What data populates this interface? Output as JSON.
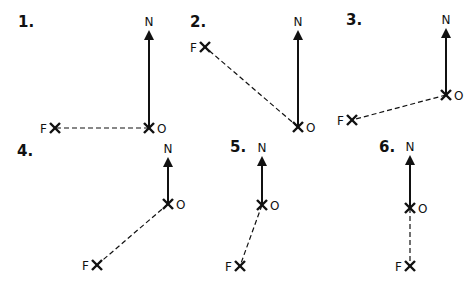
{
  "diagrams": [
    {
      "number": "1.",
      "north_label": "N",
      "origin_label": "O",
      "far_label": "F",
      "num_pos": [
        18,
        27
      ],
      "n": [
        149,
        30
      ],
      "o": [
        149,
        128
      ],
      "f": [
        55,
        128
      ]
    },
    {
      "number": "2.",
      "north_label": "N",
      "origin_label": "O",
      "far_label": "F",
      "num_pos": [
        190,
        27
      ],
      "n": [
        298,
        30
      ],
      "o": [
        298,
        127
      ],
      "f": [
        205,
        47
      ]
    },
    {
      "number": "3.",
      "north_label": "N",
      "origin_label": "O",
      "far_label": "F",
      "num_pos": [
        346,
        25
      ],
      "n": [
        446,
        28
      ],
      "o": [
        446,
        95
      ],
      "f": [
        352,
        120
      ]
    },
    {
      "number": "4.",
      "north_label": "N",
      "origin_label": "O",
      "far_label": "F",
      "num_pos": [
        17,
        156
      ],
      "n": [
        168,
        157
      ],
      "o": [
        168,
        204
      ],
      "f": [
        97,
        265
      ]
    },
    {
      "number": "5.",
      "north_label": "N",
      "origin_label": "O",
      "far_label": "F",
      "num_pos": [
        230,
        152
      ],
      "n": [
        262,
        156
      ],
      "o": [
        262,
        205
      ],
      "f": [
        240,
        266
      ]
    },
    {
      "number": "6.",
      "north_label": "N",
      "origin_label": "O",
      "far_label": "F",
      "num_pos": [
        379,
        152
      ],
      "n": [
        410,
        155
      ],
      "o": [
        410,
        208
      ],
      "f": [
        410,
        266
      ]
    }
  ],
  "colors": {
    "ink": "#111111",
    "background": "#ffffff"
  }
}
